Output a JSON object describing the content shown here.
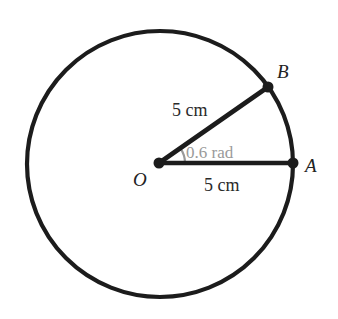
{
  "figure": {
    "kind": "circle-sector-diagram",
    "background_color": "#ffffff",
    "stroke_color": "#1c1c1c",
    "faded_color": "#9a9a9a",
    "circle": {
      "center_x": 160,
      "center_y": 164,
      "radius_px": 133,
      "stroke_width": 4.2
    },
    "points": {
      "center": {
        "label": "O",
        "x": 159,
        "y": 163,
        "label_x": 140,
        "label_y": 186
      },
      "a": {
        "label": "A",
        "x": 293,
        "y": 163,
        "label_x": 305,
        "label_y": 172
      },
      "b": {
        "label": "B",
        "x": 268,
        "y": 87,
        "label_x": 277,
        "label_y": 78
      }
    },
    "radii": [
      {
        "name": "radius-oa",
        "label": "5 cm",
        "label_x": 204,
        "label_y": 191
      },
      {
        "name": "radius-ob",
        "label": "5 cm",
        "label_x": 172,
        "label_y": 116
      }
    ],
    "angle": {
      "label": "0.6 rad",
      "value": 0.6,
      "unit": "rad",
      "degrees": 34.4,
      "label_x": 186,
      "label_y": 158,
      "arc_radius_px": 26,
      "color": "#9a9a9a"
    },
    "dot_radius_px": 5.5
  },
  "chart_data": {
    "type": "diagram",
    "labels": [
      "O",
      "A",
      "B",
      "5 cm",
      "5 cm",
      "0.6 rad"
    ],
    "radius_cm": 5,
    "angle_rad": 0.6
  }
}
